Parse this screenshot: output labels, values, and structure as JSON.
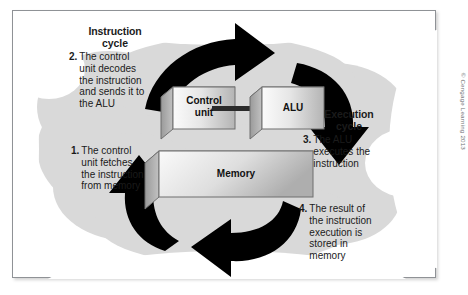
{
  "figure": {
    "type": "process-cycle-diagram",
    "credit": "© Cengage Learning 2013"
  },
  "headings": {
    "instruction_cycle": "Instruction\ncycle",
    "execution_cycle": "Execution\ncycle"
  },
  "steps": [
    {
      "number": "1.",
      "text": "The control\nunit fetches\nthe instruction\nfrom memory",
      "phase": "instruction cycle"
    },
    {
      "number": "2.",
      "text": "The control\nunit decodes\nthe instruction\nand sends it to\nthe ALU",
      "phase": "instruction cycle"
    },
    {
      "number": "3.",
      "text": "The ALU\nexecutes the\ninstruction",
      "phase": "execution cycle"
    },
    {
      "number": "4.",
      "text": "The result of\nthe instruction\nexecution is\nstored in\nmemory",
      "phase": "execution cycle"
    }
  ],
  "boxes": [
    {
      "id": "control-unit",
      "label": "Control\nunit"
    },
    {
      "id": "alu",
      "label": "ALU"
    },
    {
      "id": "memory",
      "label": "Memory"
    }
  ],
  "arrows": [
    {
      "id": "arrow-top",
      "direction": "clockwise-top-right",
      "from": "step 2 text",
      "to": "control unit / ALU"
    },
    {
      "id": "arrow-right",
      "direction": "clockwise-down",
      "from": "ALU",
      "to": "execution cycle"
    },
    {
      "id": "arrow-bottom",
      "direction": "clockwise-left",
      "from": "step 4 text",
      "to": "memory"
    },
    {
      "id": "arrow-left",
      "direction": "clockwise-up",
      "from": "memory",
      "to": "step 1 text"
    },
    {
      "id": "arrow-control-to-alu",
      "direction": "right",
      "from": "control unit",
      "to": "alu"
    }
  ],
  "colors": {
    "frame_border": "#8f9296",
    "blob_fill": "#d6d6d6",
    "arrow_fill": "#000000",
    "box_face_light": "#f2f2f2",
    "box_face_dark": "#b9b9b9",
    "box_side": "#8c8c8c",
    "box_top": "#cfcfcf",
    "text": "#1b1b1b",
    "credit_text": "#6d6f72",
    "page_background": "#ffffff"
  }
}
